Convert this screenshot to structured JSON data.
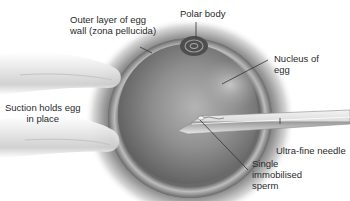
{
  "diagram": {
    "type": "illustration",
    "labels": {
      "outer_layer": "Outer layer of egg\nwall (zona pellucida)",
      "polar_body": "Polar body",
      "nucleus": "Nucleus of\negg",
      "suction": "Suction holds egg\nin place",
      "needle": "Ultra-fine needle",
      "sperm": "Single\nimmobilised\nsperm"
    },
    "components": [
      "egg",
      "zona-pellucida",
      "polar-body",
      "nucleus",
      "suction-pipette",
      "ultra-fine-needle",
      "sperm"
    ],
    "colors": {
      "background": "#ffffff",
      "egg_dark": "#4a4a4a",
      "egg_mid": "#8a8a8a",
      "label_text": "#2a2a2a",
      "leader_line": "#333333"
    }
  }
}
